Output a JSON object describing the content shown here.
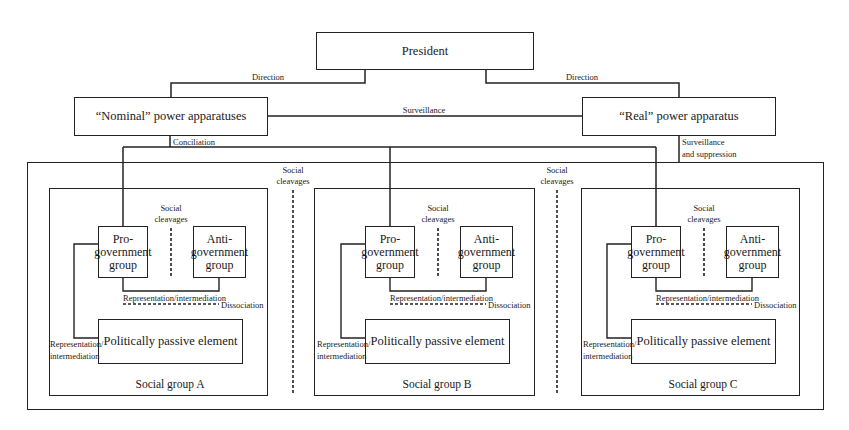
{
  "top": {
    "president": "President",
    "nominal": "“Nominal” power apparatuses",
    "real": "“Real” power apparatus",
    "direction_left": "Direction",
    "direction_right": "Direction",
    "surveillance": "Surveillance",
    "conciliation": "Conciliation",
    "surveillance_suppression_1": "Surveillance",
    "surveillance_suppression_2": "and suppression"
  },
  "outer": {
    "cleavage_left_1": "Social",
    "cleavage_left_2": "cleavages",
    "cleavage_right_1": "Social",
    "cleavage_right_2": "cleavages"
  },
  "groups": [
    {
      "title": "Social group A",
      "pro": [
        "Pro-",
        "government",
        "group"
      ],
      "anti": [
        "Anti-",
        "government",
        "group"
      ],
      "cleavage": [
        "Social",
        "cleavages"
      ],
      "rep_inter": "Representation/intermediation",
      "dissociation": "Dissociation",
      "passive": "Politically passive element",
      "rep_side": [
        "Representation/",
        "intermediation"
      ]
    },
    {
      "title": "Social group B",
      "pro": [
        "Pro-",
        "government",
        "group"
      ],
      "anti": [
        "Anti-",
        "government",
        "group"
      ],
      "cleavage": [
        "Social",
        "cleavages"
      ],
      "rep_inter": "Representation/intermediation",
      "dissociation": "Dissociation",
      "passive": "Politically passive element",
      "rep_side": [
        "Representation/",
        "intermediation"
      ]
    },
    {
      "title": "Social group C",
      "pro": [
        "Pro-",
        "government",
        "group"
      ],
      "anti": [
        "Anti-",
        "government",
        "group"
      ],
      "cleavage": [
        "Social",
        "cleavages"
      ],
      "rep_inter": "Representation/intermediation",
      "dissociation": "Dissociation",
      "passive": "Politically passive element",
      "rep_side": [
        "Representation/",
        "intermediation"
      ]
    }
  ]
}
